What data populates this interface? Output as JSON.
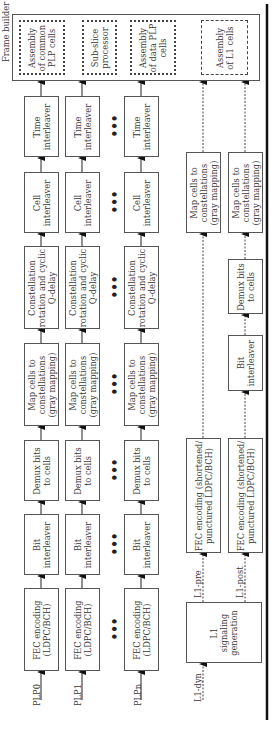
{
  "frame_builder": {
    "label": "Frame builder",
    "blocks": [
      {
        "id": "common",
        "label": "Assembly\nof common\nPLP cells",
        "style": "dotted"
      },
      {
        "id": "subslice",
        "label": "Sub-slice\nprocessor",
        "style": "dotted"
      },
      {
        "id": "data",
        "label": "Assembly\nof data PLP\ncells",
        "style": "dotted"
      },
      {
        "id": "l1",
        "label": "Assembly\nof L1 cells",
        "style": "dash-dot"
      }
    ]
  },
  "plp_chain": {
    "inputs": [
      "PLP0",
      "PLP1",
      "PLPn"
    ],
    "stages": [
      "FEC encoding\n(LDPC/BCH)",
      "Bit\ninterleaver",
      "Demux bits\nto cells",
      "Map cells to\nconstellations\n(gray mapping)",
      "Constellation\nrotation and cyclic\nQ-delay",
      "Cell\ninterleaver",
      "Time\ninterleaver"
    ],
    "ellipsis": "•••"
  },
  "l1_chain": {
    "input": "L1-dyn",
    "generator": "L1\nsignaling\ngeneration",
    "pre": {
      "label": "L1-pre",
      "fec": "FEC encoding (shortened/\npunctured LDPC/BCH)",
      "map": "Map cells to\nconstellations\n(gray mapping)"
    },
    "post": {
      "label": "L1-post",
      "fec": "FEC encoding (shortened/\npunctured LDPC/BCH)",
      "bit": "Bit\ninterleaver",
      "demux": "Demux bits\nto cells",
      "map": "Map cells to\nconstellations\n(gray mapping)"
    }
  }
}
